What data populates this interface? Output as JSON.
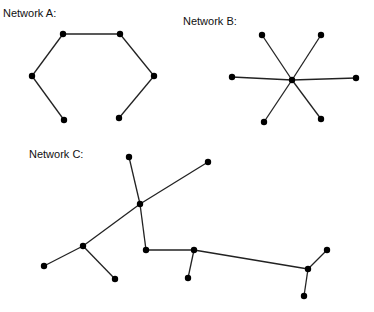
{
  "figure": {
    "networks": [
      {
        "label": "Network A:",
        "label_pos": [
          3,
          7
        ],
        "nodes": [
          [
            63,
            34
          ],
          [
            120,
            34
          ],
          [
            32,
            76
          ],
          [
            154,
            76
          ],
          [
            64,
            120
          ],
          [
            119,
            118
          ]
        ],
        "edges": [
          [
            4,
            2
          ],
          [
            2,
            0
          ],
          [
            0,
            1
          ],
          [
            1,
            3
          ],
          [
            3,
            5
          ]
        ]
      },
      {
        "label": "Network B:",
        "label_pos": [
          183,
          15
        ],
        "nodes": [
          [
            292,
            80
          ],
          [
            262,
            35
          ],
          [
            321,
            35
          ],
          [
            232,
            77
          ],
          [
            356,
            78
          ],
          [
            264,
            122
          ],
          [
            321,
            119
          ]
        ],
        "edges": [
          [
            0,
            1
          ],
          [
            0,
            2
          ],
          [
            0,
            3
          ],
          [
            0,
            4
          ],
          [
            0,
            5
          ],
          [
            0,
            6
          ]
        ]
      },
      {
        "label": "Network C:",
        "label_pos": [
          29,
          148
        ],
        "nodes": [
          [
            129,
            157
          ],
          [
            140,
            204
          ],
          [
            208,
            162
          ],
          [
            83,
            246
          ],
          [
            44,
            266
          ],
          [
            115,
            279
          ],
          [
            146,
            250
          ],
          [
            194,
            250
          ],
          [
            188,
            278
          ],
          [
            308,
            269
          ],
          [
            327,
            250
          ],
          [
            304,
            296
          ]
        ],
        "edges": [
          [
            0,
            1
          ],
          [
            1,
            2
          ],
          [
            1,
            3
          ],
          [
            3,
            4
          ],
          [
            3,
            5
          ],
          [
            1,
            6
          ],
          [
            6,
            7
          ],
          [
            7,
            8
          ],
          [
            7,
            9
          ],
          [
            9,
            10
          ],
          [
            9,
            11
          ]
        ]
      }
    ],
    "colors": {
      "edge": "#222222",
      "node": "#000000",
      "background": "#ffffff"
    }
  }
}
